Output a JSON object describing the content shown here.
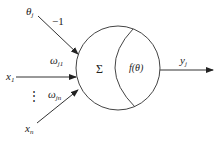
{
  "diagram": {
    "type": "artificial-neuron-model",
    "colors": {
      "stroke": "#333333",
      "text": "#222222",
      "background": "#ffffff"
    },
    "bias": {
      "symbol": "θ",
      "sub": "j",
      "weight_label": "−1"
    },
    "inputs": [
      {
        "symbol": "x",
        "sub": "1",
        "weight": "ω",
        "weight_sub": "j1"
      },
      {
        "symbol": "x",
        "sub": "n",
        "weight": "ω",
        "weight_sub": "jn"
      }
    ],
    "ellipsis": "⋮",
    "summation": "Σ",
    "activation": "f(θ)",
    "output": {
      "symbol": "y",
      "sub": "j"
    }
  }
}
